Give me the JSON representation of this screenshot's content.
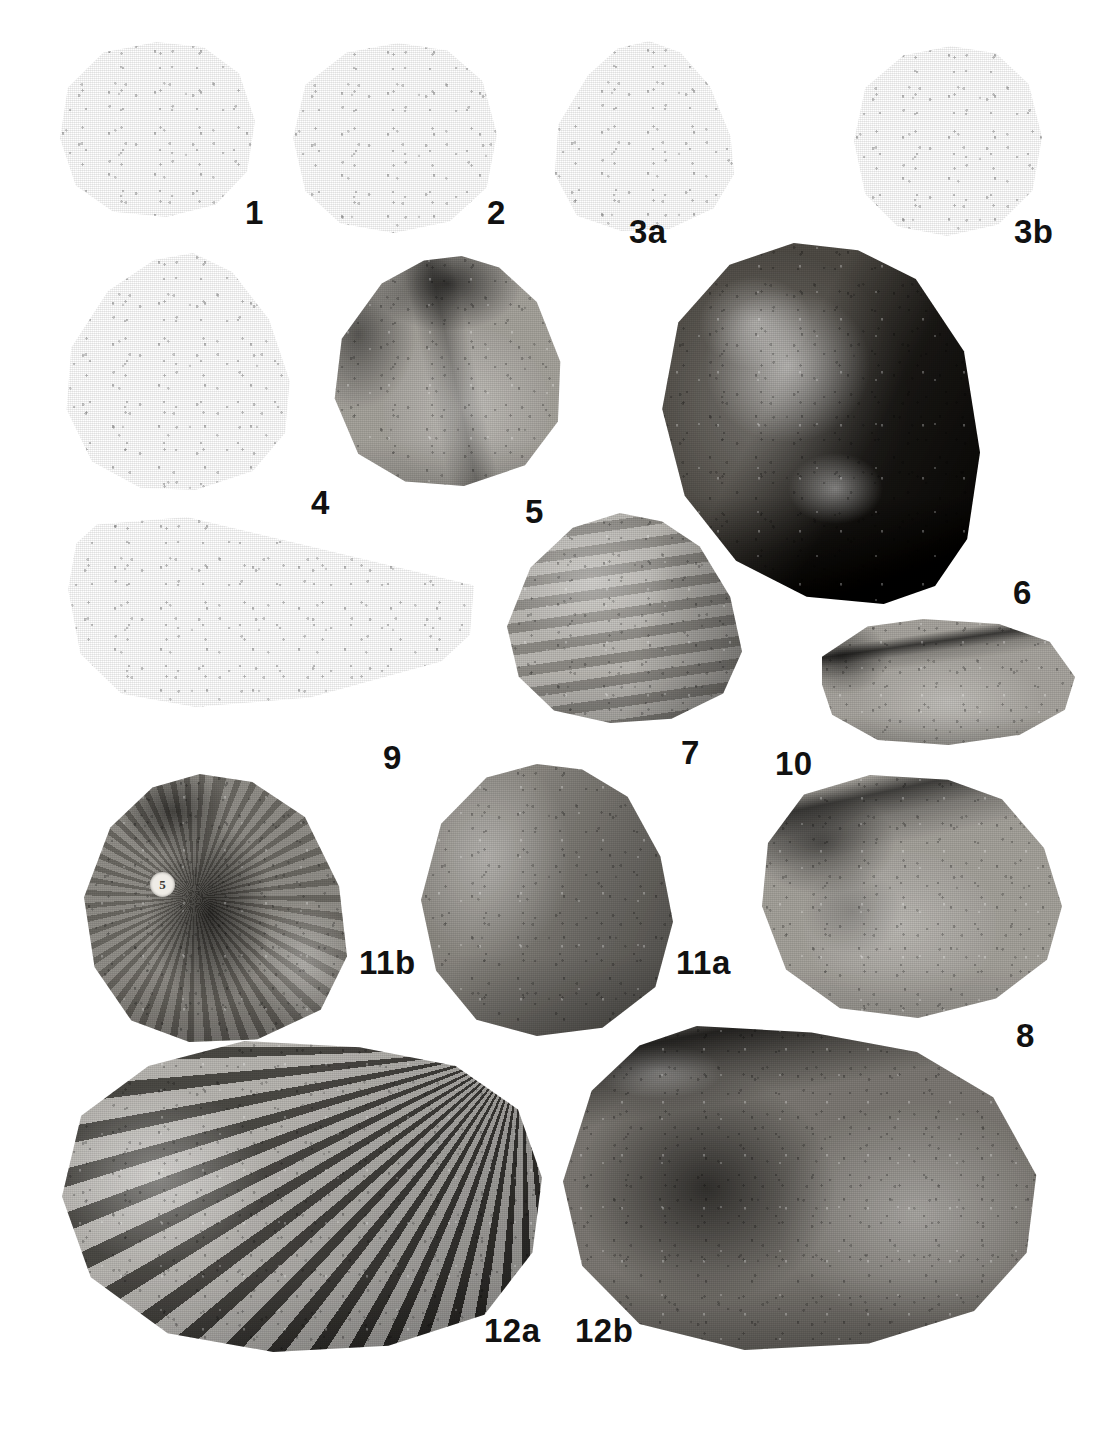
{
  "plate": {
    "title": "Fossil bivalve plate",
    "background_color": "#ffffff",
    "ink_color": "#111111",
    "width": 1112,
    "height": 1429,
    "figure_count": 14
  },
  "figures": [
    {
      "label": "1",
      "label_x": 245,
      "label_y": 196,
      "x": 58,
      "y": 42,
      "w": 197,
      "h": 175,
      "form": "round-valve-concentric",
      "tone": "#9d9a93",
      "desc": "small subcircular valve with concentric growth ribs on right margin"
    },
    {
      "label": "2",
      "label_x": 487,
      "label_y": 196,
      "x": 291,
      "y": 43,
      "w": 206,
      "h": 190,
      "form": "round-valve-dark-umbo",
      "tone": "#a3a09a",
      "desc": "subcircular valve, dark shading across umbonal region"
    },
    {
      "label": "3a",
      "label_x": 629,
      "label_y": 215,
      "x": 551,
      "y": 41,
      "w": 185,
      "h": 190,
      "form": "triangular-valve",
      "tone": "#a9a6a0",
      "desc": "subtriangular valve with faint concentric ornament"
    },
    {
      "label": "3b",
      "label_x": 1014,
      "label_y": 215,
      "x": 852,
      "y": 46,
      "w": 190,
      "h": 190,
      "form": "round-valve-dark-umbo",
      "tone": "#b2afa9",
      "desc": "same specimen, opposite valve, dark umbonal blotch"
    },
    {
      "label": "4",
      "label_x": 311,
      "label_y": 486,
      "x": 62,
      "y": 253,
      "w": 230,
      "h": 237,
      "form": "triangular-valve-ribbed",
      "tone": "#9b9891",
      "desc": "large subtriangular valve, strong concentric growth lines"
    },
    {
      "label": "5",
      "label_x": 525,
      "label_y": 495,
      "x": 330,
      "y": 256,
      "w": 235,
      "h": 230,
      "form": "interior-valve-hinge",
      "tone": "#a6a39d",
      "desc": "valve interior showing hinge teeth and dark muscle scar"
    },
    {
      "label": "6",
      "label_x": 1013,
      "label_y": 576,
      "x": 659,
      "y": 243,
      "w": 321,
      "h": 361,
      "form": "dark-matrix-valve",
      "tone": "#585550",
      "desc": "large valve in dark matrix, pale exfoliated shell patch"
    },
    {
      "label": "9",
      "label_x": 383,
      "label_y": 741,
      "x": 64,
      "y": 517,
      "w": 410,
      "h": 190,
      "form": "elongate-valve-ribbed",
      "tone": "#8f8c86",
      "desc": "elongate oblique valve with dense concentric ribs"
    },
    {
      "label": "7",
      "label_x": 681,
      "label_y": 736,
      "x": 507,
      "y": 513,
      "w": 235,
      "h": 210,
      "form": "triangular-valve-steps",
      "tone": "#b0ada7",
      "desc": "subtriangular valve with stepped concentric growth flanges"
    },
    {
      "label": "10",
      "label_x": 775,
      "label_y": 747,
      "x": 822,
      "y": 619,
      "w": 253,
      "h": 126,
      "form": "low-interior-hinge",
      "tone": "#a8a59f",
      "desc": "low elongate valve interior, thin hinge plate"
    },
    {
      "label": "11b",
      "label_x": 359,
      "label_y": 946,
      "x": 84,
      "y": 774,
      "w": 263,
      "h": 268,
      "form": "interior-valve-encrusted",
      "tone": "#807d77",
      "desc": "valve interior, encrusted surface, bears small round museum tag"
    },
    {
      "label": "11a",
      "label_x": 676,
      "label_y": 946,
      "x": 421,
      "y": 764,
      "w": 252,
      "h": 272,
      "form": "smooth-round-valve",
      "tone": "#8d8a84",
      "desc": "large smooth subcircular valve, exterior view"
    },
    {
      "label": "8",
      "label_x": 1016,
      "label_y": 1019,
      "x": 762,
      "y": 775,
      "w": 300,
      "h": 243,
      "form": "oval-interior-hinge",
      "tone": "#a5a29c",
      "desc": "oval valve interior with long hinge line and pallial markings"
    },
    {
      "label": "12a",
      "label_x": 484,
      "label_y": 1314,
      "x": 62,
      "y": 1041,
      "w": 480,
      "h": 311,
      "form": "radial-ribbed-valve",
      "tone": "#8b8882",
      "desc": "large valve exterior with coarse radial ribs"
    },
    {
      "label": "12b",
      "label_x": 575,
      "label_y": 1314,
      "x": 563,
      "y": 1026,
      "w": 478,
      "h": 324,
      "form": "oval-interior-dark",
      "tone": "#7e7b76",
      "desc": "same specimen interior, dark muscle field and hinge"
    }
  ],
  "annotations": {
    "specimen_tag": {
      "text": "5",
      "x": 150,
      "y": 872,
      "size": 25,
      "on_figure": "11b"
    }
  }
}
